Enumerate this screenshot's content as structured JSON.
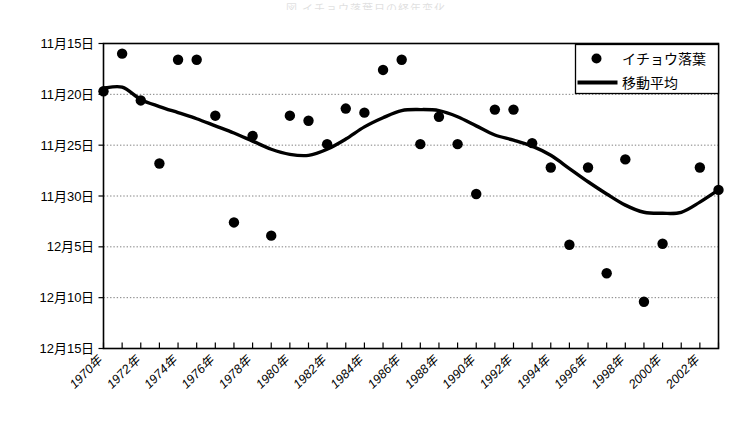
{
  "chart_data": {
    "type": "scatter",
    "title": "",
    "xlabel": "",
    "ylabel": "",
    "grid": true,
    "legend_position": "top-right",
    "x": [
      1970,
      1971,
      1972,
      1973,
      1974,
      1975,
      1976,
      1977,
      1978,
      1979,
      1980,
      1981,
      1982,
      1983,
      1984,
      1985,
      1986,
      1987,
      1988,
      1989,
      1990,
      1991,
      1992,
      1993,
      1994,
      1995,
      1996,
      1997,
      1998,
      1999,
      2000,
      2001,
      2002,
      2003
    ],
    "x_tick_labels": [
      "1970年",
      "1972年",
      "1974年",
      "1976年",
      "1978年",
      "1980年",
      "1982年",
      "1984年",
      "1986年",
      "1988年",
      "1990年",
      "1992年",
      "1994年",
      "1996年",
      "1998年",
      "2000年",
      "2002年"
    ],
    "y_tick_labels": [
      "11月15日",
      "11月20日",
      "11月25日",
      "11月30日",
      "12月5日",
      "12月10日",
      "12月15日"
    ],
    "y_tick_daynumbers": [
      15,
      20,
      25,
      30,
      35,
      40,
      45
    ],
    "ylim_daynumbers": [
      15,
      45
    ],
    "y_axis_inverted": false,
    "series": [
      {
        "name": "イチョウ落葉",
        "type": "scatter",
        "marker": "filled-circle",
        "color": "#000000",
        "points": [
          {
            "x": 1970,
            "day": 19.7,
            "label": "11月20日"
          },
          {
            "x": 1971,
            "day": 16.0,
            "label": "11月16日"
          },
          {
            "x": 1972,
            "day": 20.6,
            "label": "11月21日"
          },
          {
            "x": 1973,
            "day": 26.8,
            "label": "11月27日"
          },
          {
            "x": 1974,
            "day": 16.6,
            "label": "11月17日"
          },
          {
            "x": 1975,
            "day": 16.6,
            "label": "11月17日"
          },
          {
            "x": 1976,
            "day": 22.1,
            "label": "11月22日"
          },
          {
            "x": 1977,
            "day": 32.6,
            "label": "12月2日"
          },
          {
            "x": 1978,
            "day": 24.1,
            "label": "11月24日"
          },
          {
            "x": 1979,
            "day": 33.9,
            "label": "12月4日"
          },
          {
            "x": 1980,
            "day": 22.1,
            "label": "11月22日"
          },
          {
            "x": 1981,
            "day": 22.6,
            "label": "11月23日"
          },
          {
            "x": 1982,
            "day": 24.9,
            "label": "11月25日"
          },
          {
            "x": 1983,
            "day": 21.4,
            "label": "11月21日"
          },
          {
            "x": 1984,
            "day": 21.8,
            "label": "11月22日"
          },
          {
            "x": 1985,
            "day": 17.6,
            "label": "11月18日"
          },
          {
            "x": 1986,
            "day": 16.6,
            "label": "11月17日"
          },
          {
            "x": 1987,
            "day": 24.9,
            "label": "11月25日"
          },
          {
            "x": 1988,
            "day": 22.2,
            "label": "11月22日"
          },
          {
            "x": 1989,
            "day": 24.9,
            "label": "11月25日"
          },
          {
            "x": 1990,
            "day": 29.8,
            "label": "11月30日"
          },
          {
            "x": 1991,
            "day": 21.5,
            "label": "11月22日"
          },
          {
            "x": 1992,
            "day": 21.5,
            "label": "11月22日"
          },
          {
            "x": 1993,
            "day": 24.8,
            "label": "11月25日"
          },
          {
            "x": 1994,
            "day": 27.2,
            "label": "11月27日"
          },
          {
            "x": 1995,
            "day": 34.8,
            "label": "12月5日"
          },
          {
            "x": 1996,
            "day": 27.2,
            "label": "11月27日"
          },
          {
            "x": 1997,
            "day": 37.6,
            "label": "12月8日"
          },
          {
            "x": 1998,
            "day": 26.4,
            "label": "11月26日"
          },
          {
            "x": 1999,
            "day": 40.4,
            "label": "12月10日"
          },
          {
            "x": 2000,
            "day": 34.7,
            "label": "12月5日"
          },
          {
            "x": 2002,
            "day": 27.2,
            "label": "11月27日"
          },
          {
            "x": 2003,
            "day": 29.4,
            "label": "11月29日"
          }
        ]
      },
      {
        "name": "移動平均",
        "type": "line",
        "color": "#000000",
        "points": [
          {
            "x": 1970,
            "day": 19.4
          },
          {
            "x": 1971,
            "day": 19.3
          },
          {
            "x": 1972,
            "day": 20.5
          },
          {
            "x": 1973,
            "day": 21.2
          },
          {
            "x": 1974,
            "day": 21.8
          },
          {
            "x": 1975,
            "day": 22.4
          },
          {
            "x": 1976,
            "day": 23.1
          },
          {
            "x": 1977,
            "day": 23.8
          },
          {
            "x": 1978,
            "day": 24.6
          },
          {
            "x": 1979,
            "day": 25.4
          },
          {
            "x": 1980,
            "day": 25.9
          },
          {
            "x": 1981,
            "day": 26.0
          },
          {
            "x": 1982,
            "day": 25.4
          },
          {
            "x": 1983,
            "day": 24.4
          },
          {
            "x": 1984,
            "day": 23.2
          },
          {
            "x": 1985,
            "day": 22.3
          },
          {
            "x": 1986,
            "day": 21.6
          },
          {
            "x": 1987,
            "day": 21.5
          },
          {
            "x": 1988,
            "day": 21.6
          },
          {
            "x": 1989,
            "day": 22.2
          },
          {
            "x": 1990,
            "day": 23.1
          },
          {
            "x": 1991,
            "day": 24.0
          },
          {
            "x": 1992,
            "day": 24.5
          },
          {
            "x": 1993,
            "day": 25.1
          },
          {
            "x": 1994,
            "day": 26.0
          },
          {
            "x": 1995,
            "day": 27.3
          },
          {
            "x": 1996,
            "day": 28.6
          },
          {
            "x": 1997,
            "day": 29.8
          },
          {
            "x": 1998,
            "day": 30.9
          },
          {
            "x": 1999,
            "day": 31.6
          },
          {
            "x": 2000,
            "day": 31.7
          },
          {
            "x": 2001,
            "day": 31.6
          },
          {
            "x": 2002,
            "day": 30.6
          },
          {
            "x": 2003,
            "day": 29.4
          }
        ]
      }
    ]
  },
  "legend": {
    "items": [
      {
        "label": "イチョウ落葉",
        "marker": "dot"
      },
      {
        "label": "移動平均",
        "marker": "line"
      }
    ]
  },
  "title_strip": {
    "text": "図  イチョウ落葉日の経年変化"
  }
}
